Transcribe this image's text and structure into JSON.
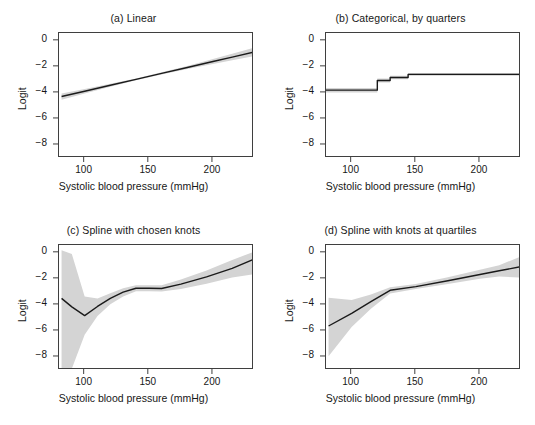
{
  "figure": {
    "width": 535,
    "height": 425,
    "background": "#ffffff",
    "band_color": "#d4d4d4",
    "line_color": "#1a1a1a",
    "axis_color": "#3f3f3f"
  },
  "chart_data": [
    {
      "id": "a",
      "type": "line",
      "title": "(a) Linear",
      "xlabel": "Systolic blood pressure (mmHg)",
      "ylabel": "Logit",
      "xlim": [
        80,
        232
      ],
      "ylim": [
        -9,
        0.6
      ],
      "xticks": [
        100,
        150,
        200
      ],
      "yticks": [
        0,
        -2,
        -4,
        -6,
        -8
      ],
      "ytick_labels": [
        "0",
        "−2",
        "−4",
        "−6",
        "−8"
      ],
      "grid": false,
      "legend": "none",
      "series": [
        {
          "name": "fitted logit",
          "x": [
            82,
            100,
            120,
            140,
            160,
            180,
            200,
            215,
            231
          ],
          "values": [
            -4.28,
            -3.87,
            -3.41,
            -2.96,
            -2.5,
            -2.05,
            -1.59,
            -1.25,
            -0.88
          ]
        }
      ],
      "confidence_band": {
        "name": "95% CI",
        "x": [
          82,
          100,
          120,
          140,
          160,
          180,
          200,
          215,
          231
        ],
        "lower": [
          -4.52,
          -4.04,
          -3.52,
          -3.03,
          -2.58,
          -2.17,
          -1.78,
          -1.5,
          -1.2
        ],
        "upper": [
          -4.05,
          -3.7,
          -3.3,
          -2.89,
          -2.42,
          -1.93,
          -1.4,
          -1.0,
          -0.55
        ]
      }
    },
    {
      "id": "b",
      "type": "line",
      "title": "(b) Categorical, by quarters",
      "xlabel": "Systolic blood pressure (mmHg)",
      "ylabel": "Logit",
      "xlim": [
        80,
        232
      ],
      "ylim": [
        -9,
        0.6
      ],
      "xticks": [
        100,
        150,
        200
      ],
      "yticks": [
        0,
        -2,
        -4,
        -6,
        -8
      ],
      "ytick_labels": [
        "0",
        "−2",
        "−4",
        "−6",
        "−8"
      ],
      "grid": false,
      "legend": "none",
      "step_breaks": [
        80,
        120,
        130,
        144,
        232
      ],
      "step_values": [
        -3.79,
        -3.05,
        -2.82,
        -2.58
      ],
      "series": [
        {
          "name": "fitted logit (step)",
          "x": [
            80,
            120,
            120,
            130,
            130,
            144,
            144,
            232
          ],
          "values": [
            -3.79,
            -3.79,
            -3.05,
            -3.05,
            -2.82,
            -2.82,
            -2.58,
            -2.58
          ]
        }
      ],
      "confidence_band": {
        "name": "95% CI",
        "x": [
          80,
          120,
          120,
          130,
          130,
          144,
          144,
          232
        ],
        "lower": [
          -3.96,
          -3.96,
          -3.2,
          -3.2,
          -2.95,
          -2.95,
          -2.68,
          -2.68
        ],
        "upper": [
          -3.62,
          -3.62,
          -2.9,
          -2.9,
          -2.69,
          -2.69,
          -2.48,
          -2.48
        ]
      }
    },
    {
      "id": "c",
      "type": "line",
      "title": "(c) Spline with chosen knots",
      "xlabel": "Systolic blood pressure (mmHg)",
      "ylabel": "Logit",
      "xlim": [
        80,
        232
      ],
      "ylim": [
        -9,
        0.6
      ],
      "xticks": [
        100,
        150,
        200
      ],
      "yticks": [
        0,
        -2,
        -4,
        -6,
        -8
      ],
      "ytick_labels": [
        "0",
        "−2",
        "−4",
        "−6",
        "−8"
      ],
      "grid": false,
      "legend": "none",
      "series": [
        {
          "name": "fitted logit",
          "x": [
            82,
            90,
            100,
            110,
            120,
            130,
            140,
            150,
            160,
            175,
            195,
            215,
            231
          ],
          "values": [
            -3.5,
            -4.15,
            -4.82,
            -4.12,
            -3.5,
            -3.02,
            -2.72,
            -2.72,
            -2.74,
            -2.4,
            -1.85,
            -1.2,
            -0.53
          ]
        }
      ],
      "confidence_band": {
        "name": "95% CI",
        "x": [
          82,
          90,
          100,
          110,
          120,
          130,
          140,
          150,
          160,
          175,
          195,
          215,
          231
        ],
        "lower": [
          -8.9,
          -8.9,
          -6.3,
          -4.85,
          -3.95,
          -3.35,
          -2.95,
          -2.95,
          -2.98,
          -2.78,
          -2.38,
          -1.9,
          -1.65
        ],
        "upper": [
          0.2,
          -0.1,
          -3.35,
          -3.5,
          -3.1,
          -2.72,
          -2.5,
          -2.5,
          -2.5,
          -2.05,
          -1.35,
          -0.55,
          0.05
        ]
      }
    },
    {
      "id": "d",
      "type": "line",
      "title": "(d) Spline with knots at quartiles",
      "xlabel": "Systolic blood pressure (mmHg)",
      "ylabel": "Logit",
      "xlim": [
        80,
        232
      ],
      "ylim": [
        -9,
        0.6
      ],
      "xticks": [
        100,
        150,
        200
      ],
      "yticks": [
        0,
        -2,
        -4,
        -6,
        -8
      ],
      "ytick_labels": [
        "0",
        "−2",
        "−4",
        "−6",
        "−8"
      ],
      "grid": false,
      "legend": "none",
      "series": [
        {
          "name": "fitted logit",
          "x": [
            82,
            100,
            115,
            130,
            150,
            175,
            200,
            215,
            231
          ],
          "values": [
            -5.62,
            -4.65,
            -3.75,
            -2.88,
            -2.6,
            -2.15,
            -1.67,
            -1.38,
            -1.08
          ]
        }
      ],
      "confidence_band": {
        "name": "95% CI",
        "x": [
          82,
          100,
          115,
          130,
          150,
          175,
          200,
          215,
          231
        ],
        "lower": [
          -7.95,
          -5.7,
          -4.3,
          -3.12,
          -2.78,
          -2.4,
          -2.0,
          -1.82,
          -1.9
        ],
        "upper": [
          -3.45,
          -3.62,
          -3.2,
          -2.65,
          -2.4,
          -1.88,
          -1.3,
          -0.95,
          -0.32
        ]
      }
    }
  ]
}
